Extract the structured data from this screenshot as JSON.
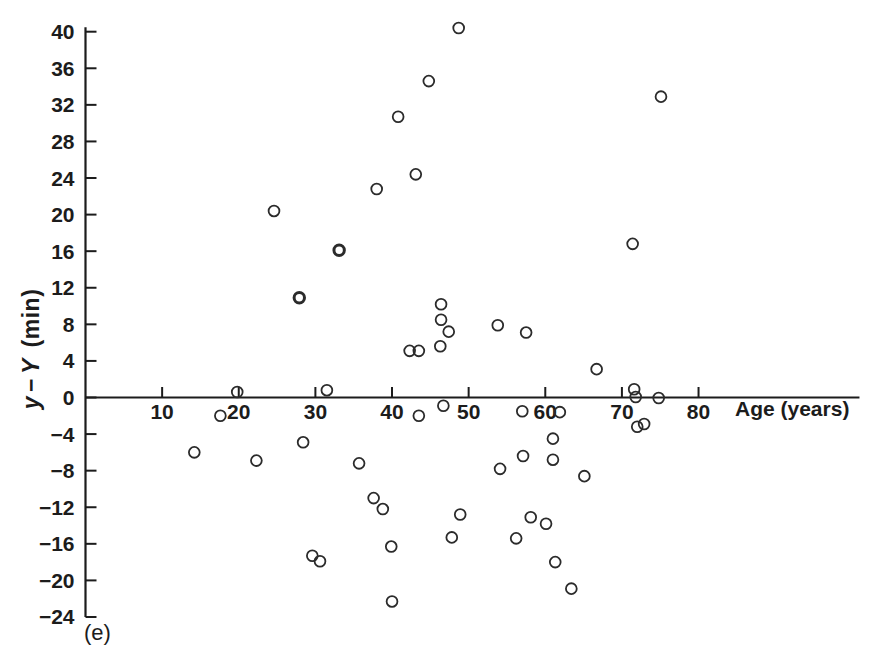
{
  "figure_label": "(e)",
  "axes": {
    "x": {
      "label": "Age (years)",
      "ticks": [
        10,
        20,
        30,
        40,
        50,
        60,
        70,
        80
      ]
    },
    "y": {
      "label_var1": "y",
      "label_minus": "−",
      "label_var2": "Y",
      "label_unit": "(min)",
      "ticks": [
        40,
        36,
        32,
        28,
        24,
        20,
        16,
        12,
        8,
        4,
        0,
        -4,
        -8,
        -12,
        -16,
        -20,
        -24
      ]
    }
  },
  "chart_data": {
    "type": "scatter",
    "title": "",
    "xlabel": "Age (years)",
    "ylabel": "y − Y (min)",
    "xlim": [
      0,
      101
    ],
    "ylim": [
      -24,
      40.5
    ],
    "x_ticks": [
      10,
      20,
      30,
      40,
      50,
      60,
      70,
      80
    ],
    "y_ticks": [
      40,
      36,
      32,
      28,
      24,
      20,
      16,
      12,
      8,
      4,
      0,
      -4,
      -8,
      -12,
      -16,
      -20,
      -24
    ],
    "grid": false,
    "legend": null,
    "marker": "open-circle",
    "axis_color": "#1c1c1c",
    "marker_color": "#2b2b2b",
    "points": [
      [
        48.7,
        40.4
      ],
      [
        44.8,
        34.6
      ],
      [
        40.8,
        30.7
      ],
      [
        43.1,
        24.4
      ],
      [
        38.0,
        22.8
      ],
      [
        24.6,
        20.4
      ],
      [
        75.1,
        32.9
      ],
      [
        71.4,
        16.8
      ],
      [
        46.4,
        10.2
      ],
      [
        46.4,
        8.5
      ],
      [
        53.8,
        7.9
      ],
      [
        47.4,
        7.2
      ],
      [
        57.5,
        7.1
      ],
      [
        46.3,
        5.6
      ],
      [
        42.3,
        5.1
      ],
      [
        43.5,
        5.1
      ],
      [
        66.7,
        3.1
      ],
      [
        19.8,
        0.6
      ],
      [
        31.5,
        0.8
      ],
      [
        71.6,
        0.9
      ],
      [
        71.8,
        0.05
      ],
      [
        74.8,
        -0.05
      ],
      [
        17.6,
        -2.0
      ],
      [
        43.5,
        -2.0
      ],
      [
        46.7,
        -0.9
      ],
      [
        57.0,
        -1.5
      ],
      [
        61.9,
        -1.6
      ],
      [
        14.2,
        -6.0
      ],
      [
        28.4,
        -4.9
      ],
      [
        22.3,
        -6.9
      ],
      [
        35.7,
        -7.2
      ],
      [
        72.0,
        -3.2
      ],
      [
        72.9,
        -2.9
      ],
      [
        61.0,
        -4.5
      ],
      [
        57.1,
        -6.4
      ],
      [
        61.0,
        -6.8
      ],
      [
        54.1,
        -7.8
      ],
      [
        65.1,
        -8.6
      ],
      [
        37.6,
        -11.0
      ],
      [
        38.8,
        -12.2
      ],
      [
        48.9,
        -12.8
      ],
      [
        58.1,
        -13.1
      ],
      [
        60.1,
        -13.8
      ],
      [
        47.8,
        -15.3
      ],
      [
        56.2,
        -15.4
      ],
      [
        39.9,
        -16.3
      ],
      [
        29.6,
        -17.3
      ],
      [
        30.6,
        -17.9
      ],
      [
        61.3,
        -18.0
      ],
      [
        63.4,
        -20.9
      ],
      [
        40.0,
        -22.3
      ]
    ],
    "emphasized_points": [
      [
        33.1,
        16.1
      ],
      [
        27.9,
        10.9
      ]
    ]
  }
}
